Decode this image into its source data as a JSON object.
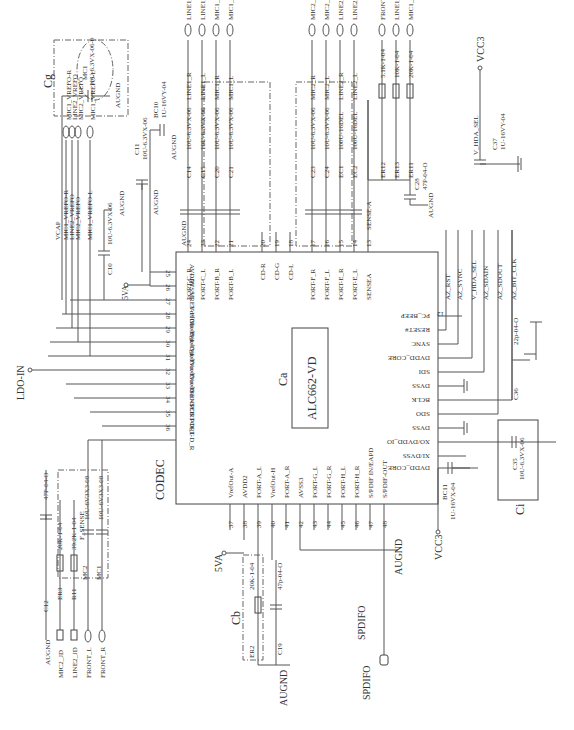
{
  "chip": {
    "ref": "Ca",
    "part": "ALC662-VD",
    "block_label": "CODEC",
    "top_pins": [
      {
        "num": "24",
        "name": "PORT-C_R"
      },
      {
        "num": "23",
        "name": "PORT-C_L"
      },
      {
        "num": "22",
        "name": "PORT-B_R"
      },
      {
        "num": "21",
        "name": "PORT-B_L"
      },
      {
        "num": "20",
        "name": "CD-R"
      },
      {
        "num": "19",
        "name": "CD-G"
      },
      {
        "num": "18",
        "name": "CD-L"
      },
      {
        "num": "17",
        "name": "PORT-F_R"
      },
      {
        "num": "16",
        "name": "PORT-F_L"
      },
      {
        "num": "15",
        "name": "PORT-E_R"
      },
      {
        "num": "14",
        "name": "PORT-E_L"
      },
      {
        "num": "13",
        "name": "SENSEA"
      }
    ],
    "left_pins": [
      {
        "num": "25",
        "name": "AVDD1"
      },
      {
        "num": "26",
        "name": "AVSS1"
      },
      {
        "num": "27",
        "name": "VREF-FILT"
      },
      {
        "num": "28",
        "name": "VrefOut-B_L"
      },
      {
        "num": "29",
        "name": "VrefOut-C_L"
      },
      {
        "num": "30",
        "name": "VrefOut-F"
      },
      {
        "num": "31",
        "name": "VrefOut-E"
      },
      {
        "num": "32",
        "name": "VrefOut-D"
      },
      {
        "num": "33",
        "name": "VrefOut-G"
      },
      {
        "num": "34",
        "name": "SENSEB"
      },
      {
        "num": "35",
        "name": "PORT-D_L"
      },
      {
        "num": "36",
        "name": "PORT-D_R"
      }
    ],
    "right_pins": [
      {
        "num": "12",
        "name": "PC_BEEP"
      },
      {
        "num": "11",
        "name": "RESET#"
      },
      {
        "num": "10",
        "name": "SYNC"
      },
      {
        "num": "9",
        "name": "DVDD_CORE"
      },
      {
        "num": "8",
        "name": "SDI"
      },
      {
        "num": "7",
        "name": "DVSS"
      },
      {
        "num": "6",
        "name": "BCLK"
      },
      {
        "num": "5",
        "name": "SDO"
      },
      {
        "num": "4",
        "name": "DVSS"
      },
      {
        "num": "3",
        "name": "XO/DVDD_IO"
      },
      {
        "num": "2",
        "name": "XI/DVSS"
      },
      {
        "num": "1",
        "name": "DVDD_CORE"
      }
    ],
    "bottom_pins": [
      {
        "num": "37",
        "name": "VrefOut-A"
      },
      {
        "num": "38",
        "name": "AVDD2"
      },
      {
        "num": "39",
        "name": "PORT-A_L"
      },
      {
        "num": "40",
        "name": "VrefOut-H"
      },
      {
        "num": "41",
        "name": "PORT-A_R"
      },
      {
        "num": "42",
        "name": "AVSS3"
      },
      {
        "num": "43",
        "name": "PORT-G_L"
      },
      {
        "num": "44",
        "name": "PORT-G_R"
      },
      {
        "num": "45",
        "name": "PORT-H_L"
      },
      {
        "num": "46",
        "name": "PORT-H_R"
      },
      {
        "num": "47",
        "name": "S/PDIF IN/EAPD"
      },
      {
        "num": "48",
        "name": "S/PDIF-OUT"
      }
    ]
  },
  "right_nets": [
    "AZ_RST",
    "AZ_SYNC",
    "V_HDA_SEL",
    "AZ_SDAIN",
    "AZ_SDOUT",
    "AZ_BIT_CLK"
  ],
  "top_coupling_caps": [
    {
      "ref": "C14",
      "value": "10U-6.3VX-06",
      "net": "LINE1_R",
      "connector": "LINE1_R"
    },
    {
      "ref": "C15",
      "value": "10U-6.3VX-06",
      "net": "LINE1_L",
      "connector": "LINE1_L"
    },
    {
      "ref": "C20",
      "value": "10U-6.3VX-06",
      "net": "MIC1_R",
      "connector": "MIC1_R"
    },
    {
      "ref": "C21",
      "value": "10U-6.3VX-06",
      "net": "MIC1_L",
      "connector": "MIC1_L"
    }
  ],
  "top_coupling_caps_2": [
    {
      "ref": "C23",
      "value": "10U-6.3VX-06",
      "net": "MIC2_R",
      "connector": "MIC2_R"
    },
    {
      "ref": "C24",
      "value": "10U-6.3VX-06",
      "net": "MIC2_L",
      "connector": "MIC2_L"
    },
    {
      "ref": "EC1",
      "value": "100U-16DEL",
      "net": "LINE2_R",
      "connector": "LINE2_R"
    },
    {
      "ref": "EC2",
      "value": "100U-16DEL",
      "net": "LINE2_L",
      "connector": "LINE2_L"
    }
  ],
  "sense_resistors": [
    {
      "ref": "ER12",
      "value": "5.1K-1-04",
      "connector": "FRONT_JD"
    },
    {
      "ref": "ER13",
      "value": "10K-1-04",
      "connector": "LINE1_JD"
    },
    {
      "ref": "ER11",
      "value": "20K-1-04",
      "connector": "MIC1_JD"
    }
  ],
  "sense_net": "SENSE-A",
  "c28": {
    "ref": "C28",
    "value": "47P-04-O"
  },
  "vref_nets": [
    "VCAP",
    "MIC1_VREFO-R",
    "LINE2_VREFO",
    "MIC2_VREFO",
    "MIC1_VREFO-L"
  ],
  "vref_connectors": [
    "MIC1_VREFO-R",
    "LINE2_VREFO",
    "MIC2_VREFO",
    "MIC1_VREFO-L"
  ],
  "cg": {
    "label": "Cg",
    "ref": "MC1",
    "value": "10U-6.3VX-06-0"
  },
  "c10": {
    "ref": "C10",
    "value": "10U-6.3VX-06"
  },
  "c11": {
    "ref": "C11",
    "value": "10U-6.3VX-06"
  },
  "bc10": {
    "ref": "BC10",
    "value": "1U-16VY-04"
  },
  "c37": {
    "ref": "C37",
    "value": "1U-16VY-04",
    "net": "V_HDA_SEL",
    "power": "VCC3"
  },
  "c36": {
    "ref": "C36",
    "value": "22p-04-O"
  },
  "ci": {
    "label": "Ci",
    "ref": "C35",
    "value": "10U-6.3VX-06"
  },
  "bc11": {
    "ref": "BC11",
    "value": "1U-16VX-04",
    "power": "VCC3"
  },
  "cb": {
    "label": "Cb",
    "ref": "ER2",
    "value": "20K-1-04",
    "cap_ref": "C19",
    "cap_value": "47p-04-O"
  },
  "left_bottom": {
    "c12": {
      "ref": "C12",
      "value": "47P-04-O"
    },
    "er3": {
      "ref": "ER3",
      "value": "20K-1-04"
    },
    "r11": {
      "ref": "R11",
      "value": "39.2K-1-04"
    },
    "mc2": {
      "ref": "MC2",
      "value": "10U-6V3X3-08"
    },
    "mc1": {
      "ref": "MC1",
      "value": "10U-6V3X3-08"
    },
    "sense": "F_SENSE",
    "connectors": [
      "MIC2_JD",
      "LINE2_JD",
      "FRONT_L",
      "FRONT_R"
    ]
  },
  "power": {
    "avdd": "5VA",
    "gnd": "AUGND",
    "vcc": "VCC3",
    "ldo": "LDO-IN"
  },
  "spdif": {
    "net": "SPDIFO",
    "connector": "SPDIFO"
  }
}
